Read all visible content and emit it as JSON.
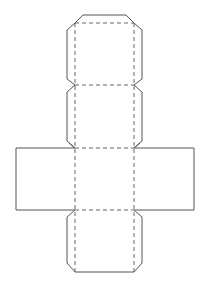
{
  "diagram": {
    "type": "box-net",
    "colors": {
      "cut_line": "#555555",
      "fold_line": "#666666",
      "background": "#ffffff"
    },
    "line_styles": {
      "cut": "solid",
      "fold": "dashed"
    },
    "panels": [
      {
        "id": "top-flap-panel",
        "has_side_tabs": true,
        "has_end_tab": true
      },
      {
        "id": "upper-panel",
        "has_side_tabs": true,
        "has_end_tab": false
      },
      {
        "id": "center-panel",
        "has_side_flaps": true
      },
      {
        "id": "bottom-panel",
        "has_side_tabs": true,
        "has_end_tab": true
      }
    ],
    "side_flaps": [
      "left-flap",
      "right-flap"
    ]
  }
}
